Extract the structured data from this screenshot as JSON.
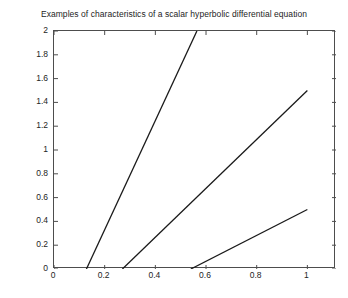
{
  "chart_data": {
    "type": "line",
    "title": "Examples of characteristics of a scalar hyperbolic differential equation",
    "xlabel": "",
    "ylabel": "",
    "xlim": [
      0,
      1.113
    ],
    "ylim": [
      0,
      2
    ],
    "grid": false,
    "legend": null,
    "x_ticks": [
      0,
      0.2,
      0.4,
      0.6,
      0.8,
      1
    ],
    "x_tick_labels": [
      "0",
      "0.2",
      "0.4",
      "0.6",
      "0.8",
      "1"
    ],
    "y_ticks": [
      0,
      0.2,
      0.4,
      0.6,
      0.8,
      1,
      1.2,
      1.4,
      1.6,
      1.8,
      2
    ],
    "y_tick_labels": [
      "0",
      "0.2",
      "0.4",
      "0.6",
      "0.8",
      "1",
      "1.2",
      "1.4",
      "1.6",
      "1.8",
      "2"
    ],
    "line_color": "#1a1a1a",
    "line_width": 1.3,
    "series": [
      {
        "name": "characteristic-1",
        "x": [
          0.128,
          0.564
        ],
        "y": [
          0,
          2
        ]
      },
      {
        "name": "characteristic-2",
        "x": [
          0.27,
          1.0
        ],
        "y": [
          0,
          1.5
        ]
      },
      {
        "name": "characteristic-3",
        "x": [
          0.54,
          1.0
        ],
        "y": [
          0,
          0.5
        ]
      }
    ]
  }
}
